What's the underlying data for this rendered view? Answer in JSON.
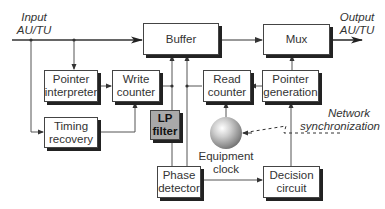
{
  "diagram": {
    "input_label": [
      "Input",
      "AU/TU"
    ],
    "output_label": [
      "Output",
      "AU/TU"
    ],
    "blocks": {
      "buffer": "Buffer",
      "mux": "Mux",
      "pointer_interpreter": [
        "Pointer",
        "interpreter"
      ],
      "write_counter": [
        "Write",
        "counter"
      ],
      "read_counter": [
        "Read",
        "counter"
      ],
      "pointer_generation": [
        "Pointer",
        "generation"
      ],
      "timing_recovery": [
        "Timing",
        "recovery"
      ],
      "lp_filter": [
        "LP",
        "filter"
      ],
      "phase_detector": [
        "Phase",
        "detector"
      ],
      "decision_circuit": [
        "Decision",
        "circuit"
      ]
    },
    "equipment_clock_label": [
      "Equipment",
      "clock"
    ],
    "network_sync_label": [
      "Network",
      "synchronization"
    ],
    "colors": {
      "line": "#444444",
      "box_border": "#444444",
      "shadow": "#222222",
      "lp_filter_fill": "#a9a9a9"
    }
  }
}
